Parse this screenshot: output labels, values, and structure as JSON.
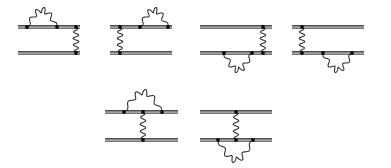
{
  "figure": {
    "name": "feynman-diagram-set",
    "background_color": "#ffffff",
    "line_color": "#151515",
    "line_secondary_color": "#4a4a4a",
    "photon_color": "#2b2b2b",
    "vertex_color": "#0a0a0a",
    "width": 391,
    "height": 168,
    "rows": [
      {
        "name": "top-row",
        "diagram_count": 4
      },
      {
        "name": "bottom-row",
        "diagram_count": 2
      }
    ],
    "diagrams": [
      {
        "id": "diagram-1",
        "label": "",
        "row": "top-row",
        "x_start": 18,
        "x_end": 80,
        "upper_line_y": 27,
        "lower_line_y": 53,
        "self_energy": {
          "present": true,
          "on": "upper",
          "side": "above",
          "x1": 27,
          "x2": 57,
          "arc_height": 17,
          "waves": 5
        },
        "exchange_photon": {
          "present": true,
          "x": 76,
          "from_y": 27,
          "to_y": 53,
          "waves": 4
        },
        "vertices": [
          {
            "x": 27,
            "y": 27
          },
          {
            "x": 57,
            "y": 27
          },
          {
            "x": 76,
            "y": 27
          },
          {
            "x": 76,
            "y": 53
          }
        ]
      },
      {
        "id": "diagram-2",
        "label": "",
        "row": "top-row",
        "x_start": 110,
        "x_end": 172,
        "upper_line_y": 27,
        "lower_line_y": 53,
        "self_energy": {
          "present": true,
          "on": "upper",
          "side": "above",
          "x1": 140,
          "x2": 168,
          "arc_height": 17,
          "waves": 5
        },
        "exchange_photon": {
          "present": true,
          "x": 120,
          "from_y": 27,
          "to_y": 53,
          "waves": 4
        },
        "vertices": [
          {
            "x": 120,
            "y": 27
          },
          {
            "x": 140,
            "y": 27
          },
          {
            "x": 168,
            "y": 27
          },
          {
            "x": 120,
            "y": 53
          }
        ]
      },
      {
        "id": "diagram-3",
        "label": "",
        "row": "top-row",
        "x_start": 200,
        "x_end": 272,
        "upper_line_y": 27,
        "lower_line_y": 53,
        "self_energy": {
          "present": true,
          "on": "lower",
          "side": "below",
          "x1": 224,
          "x2": 252,
          "arc_height": 17,
          "waves": 5
        },
        "exchange_photon": {
          "present": true,
          "x": 263,
          "from_y": 27,
          "to_y": 53,
          "waves": 4
        },
        "vertices": [
          {
            "x": 263,
            "y": 27
          },
          {
            "x": 224,
            "y": 53
          },
          {
            "x": 252,
            "y": 53
          },
          {
            "x": 263,
            "y": 53
          }
        ]
      },
      {
        "id": "diagram-4",
        "label": "",
        "row": "top-row",
        "x_start": 292,
        "x_end": 364,
        "upper_line_y": 27,
        "lower_line_y": 53,
        "self_energy": {
          "present": true,
          "on": "lower",
          "side": "below",
          "x1": 323,
          "x2": 352,
          "arc_height": 17,
          "waves": 5
        },
        "exchange_photon": {
          "present": true,
          "x": 302,
          "from_y": 27,
          "to_y": 53,
          "waves": 4
        },
        "vertices": [
          {
            "x": 302,
            "y": 27
          },
          {
            "x": 302,
            "y": 53
          },
          {
            "x": 323,
            "y": 53
          },
          {
            "x": 352,
            "y": 53
          }
        ]
      },
      {
        "id": "diagram-5",
        "label": "",
        "row": "bottom-row",
        "x_start": 105,
        "x_end": 178,
        "upper_line_y": 112,
        "lower_line_y": 140,
        "self_energy": {
          "present": true,
          "on": "upper",
          "side": "above",
          "x1": 124,
          "x2": 162,
          "arc_height": 20,
          "waves": 5
        },
        "exchange_photon": {
          "present": true,
          "x": 143,
          "from_y": 112,
          "to_y": 140,
          "waves": 4
        },
        "vertices": [
          {
            "x": 124,
            "y": 112
          },
          {
            "x": 143,
            "y": 112
          },
          {
            "x": 162,
            "y": 112
          },
          {
            "x": 143,
            "y": 140
          }
        ]
      },
      {
        "id": "diagram-6",
        "label": "",
        "row": "bottom-row",
        "x_start": 200,
        "x_end": 272,
        "upper_line_y": 112,
        "lower_line_y": 140,
        "self_energy": {
          "present": true,
          "on": "lower",
          "side": "below",
          "x1": 218,
          "x2": 253,
          "arc_height": 20,
          "waves": 5
        },
        "exchange_photon": {
          "present": true,
          "x": 236,
          "from_y": 112,
          "to_y": 140,
          "waves": 4
        },
        "vertices": [
          {
            "x": 236,
            "y": 112
          },
          {
            "x": 218,
            "y": 140
          },
          {
            "x": 236,
            "y": 140
          },
          {
            "x": 253,
            "y": 140
          }
        ]
      }
    ],
    "style": {
      "double_line_gap": 2.4,
      "double_line_width": 1.3,
      "vertex_radius": 1.9,
      "photon_amplitude": 2.8
    }
  }
}
